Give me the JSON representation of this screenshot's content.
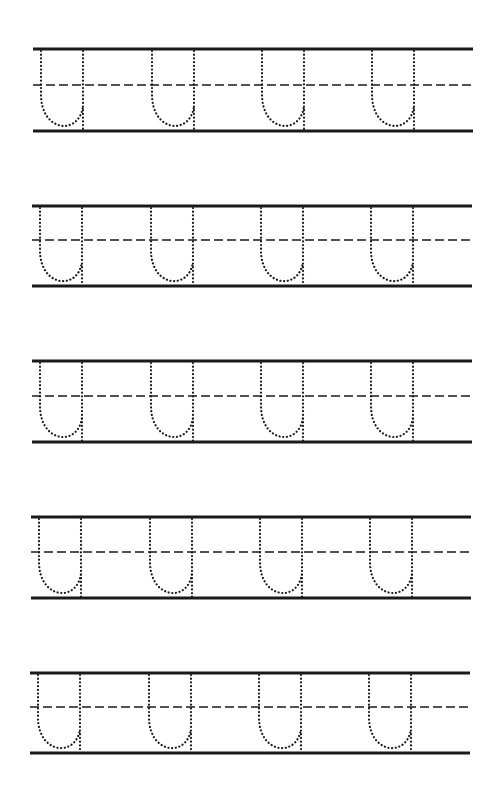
{
  "worksheet": {
    "type": "handwriting-practice",
    "letter": "u",
    "letter_style": "dotted-tracing",
    "colors": {
      "ink": "#1a1a1a",
      "background": "#ffffff"
    },
    "rows": [
      {
        "top": 49,
        "mid": 85,
        "bottom": 131,
        "x_start": 33,
        "x_end": 473,
        "letters_x": [
          41,
          152,
          262,
          372
        ]
      },
      {
        "top": 206,
        "mid": 240,
        "bottom": 286,
        "x_start": 32,
        "x_end": 472,
        "letters_x": [
          40,
          151,
          261,
          371
        ]
      },
      {
        "top": 361,
        "mid": 396,
        "bottom": 442,
        "x_start": 32,
        "x_end": 472,
        "letters_x": [
          40,
          151,
          261,
          371
        ]
      },
      {
        "top": 517,
        "mid": 552,
        "bottom": 598,
        "x_start": 31,
        "x_end": 471,
        "letters_x": [
          39,
          150,
          260,
          370
        ]
      },
      {
        "top": 673,
        "mid": 707,
        "bottom": 753,
        "x_start": 30,
        "x_end": 470,
        "letters_x": [
          38,
          149,
          259,
          369
        ]
      }
    ],
    "letter_width": 42
  }
}
